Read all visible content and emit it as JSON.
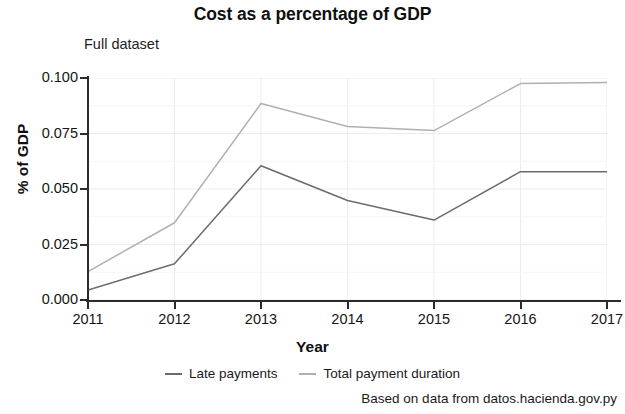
{
  "chart_data": {
    "type": "line",
    "title": "Cost as a percentage of GDP",
    "subtitle": "Full dataset",
    "xlabel": "Year",
    "ylabel": "% of GDP",
    "caption": "Based on data from datos.hacienda.gov.py",
    "x": [
      2011,
      2012,
      2013,
      2014,
      2015,
      2016,
      2017
    ],
    "xtick_labels": [
      "2011",
      "2012",
      "2013",
      "2014",
      "2015",
      "2016",
      "2017"
    ],
    "ytick_labels": [
      "0.000",
      "0.025",
      "0.050",
      "0.075",
      "0.100"
    ],
    "ytick_values": [
      0.0,
      0.025,
      0.05,
      0.075,
      0.1
    ],
    "xlim": [
      2011,
      2017
    ],
    "ylim": [
      0.0,
      0.1
    ],
    "grid": true,
    "legend_position": "bottom",
    "series": [
      {
        "name": "Late payments",
        "color": "#6b6b6b",
        "values": [
          0.0045,
          0.0163,
          0.0605,
          0.0448,
          0.036,
          0.0578,
          0.0578
        ]
      },
      {
        "name": "Total payment duration",
        "color": "#b0b0b0",
        "values": [
          0.0128,
          0.0348,
          0.0885,
          0.0782,
          0.0763,
          0.0975,
          0.098
        ]
      }
    ]
  }
}
